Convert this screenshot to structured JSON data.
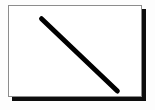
{
  "figure": {
    "canvas": {
      "background_color": "#ffffff",
      "border_color": "#8c8c8c",
      "border_width": 1,
      "shadow_color": "#0d0d0d",
      "shadow_offset_x": 4,
      "shadow_offset_y": 4,
      "x": 8,
      "y": 5,
      "width": 134,
      "height": 92
    },
    "page_background_color": "#fdfdfd"
  },
  "chart_data": {
    "type": "line",
    "subtitle": "",
    "xlabel": "",
    "ylabel": "",
    "grid": false,
    "legend_position": "none",
    "axis_visible": false,
    "tick_labels_x": [],
    "tick_labels_y": [],
    "xlim": [
      0,
      134
    ],
    "ylim": [
      0,
      92
    ],
    "series": [
      {
        "name": "diagonal-stroke",
        "color": "#000000",
        "stroke_width": 5,
        "line_cap": "round",
        "x": [
          33,
          110
        ],
        "y": [
          13,
          87
        ],
        "points": [
          {
            "x": 33,
            "y": 13
          },
          {
            "x": 110,
            "y": 87
          }
        ]
      }
    ],
    "annotations": []
  }
}
